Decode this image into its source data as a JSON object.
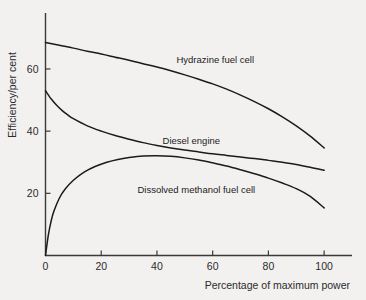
{
  "chart_data": {
    "type": "line",
    "title": "",
    "xlabel": "Percentage of maximum power",
    "ylabel": "Efficiency/per cent",
    "xlim": [
      0,
      110
    ],
    "ylim": [
      0,
      78
    ],
    "grid": false,
    "legend_position": "inline-annotations",
    "xticks": [
      0,
      20,
      40,
      60,
      80,
      100
    ],
    "xtick_labels": [
      "0",
      "20",
      "40",
      "60",
      "80",
      "100"
    ],
    "yticks": [
      20,
      40,
      60
    ],
    "ytick_labels": [
      "20",
      "40",
      "60"
    ],
    "origin_label": "0",
    "series": [
      {
        "name": "Hydrazine fuel cell",
        "label_x": 47,
        "label_y": 62,
        "x": [
          0,
          5,
          10,
          15,
          20,
          25,
          30,
          35,
          40,
          45,
          50,
          55,
          60,
          65,
          70,
          75,
          80,
          85,
          90,
          95,
          100
        ],
        "values": [
          68.5,
          67.6,
          66.7,
          65.7,
          64.8,
          63.8,
          62.8,
          61.7,
          60.6,
          59.4,
          58.1,
          56.7,
          55.2,
          53.5,
          51.6,
          49.5,
          47.2,
          44.6,
          41.7,
          38.4,
          34.6
        ]
      },
      {
        "name": "Diesel engine",
        "label_x": 42,
        "label_y": 36,
        "x": [
          0,
          2,
          4,
          6,
          8,
          10,
          15,
          20,
          25,
          30,
          35,
          40,
          45,
          50,
          55,
          60,
          65,
          70,
          75,
          80,
          85,
          90,
          95,
          100
        ],
        "values": [
          53.0,
          50.4,
          48.3,
          46.6,
          45.2,
          44.0,
          41.7,
          40.0,
          38.6,
          37.4,
          36.3,
          35.4,
          34.6,
          33.9,
          33.3,
          32.7,
          32.2,
          31.7,
          31.2,
          30.6,
          30.0,
          29.3,
          28.4,
          27.4
        ]
      },
      {
        "name": "Dissolved methanol fuel cell",
        "label_x": 33,
        "label_y": 20,
        "x": [
          0,
          1,
          2,
          3,
          5,
          7,
          10,
          14,
          18,
          22,
          26,
          30,
          35,
          40,
          45,
          50,
          55,
          60,
          65,
          70,
          75,
          80,
          85,
          90,
          95,
          100
        ],
        "values": [
          0.0,
          6.5,
          11.0,
          14.2,
          18.5,
          21.3,
          24.2,
          26.9,
          28.7,
          30.0,
          30.9,
          31.5,
          32.0,
          32.1,
          31.9,
          31.4,
          30.7,
          29.8,
          28.8,
          27.6,
          26.3,
          24.9,
          23.3,
          21.5,
          19.0,
          15.3
        ]
      }
    ],
    "colors": {
      "line": "#1b1b1b",
      "axis": "#3a3a3a",
      "background": "#f2f1ef",
      "text": "#2b2b2b"
    }
  }
}
